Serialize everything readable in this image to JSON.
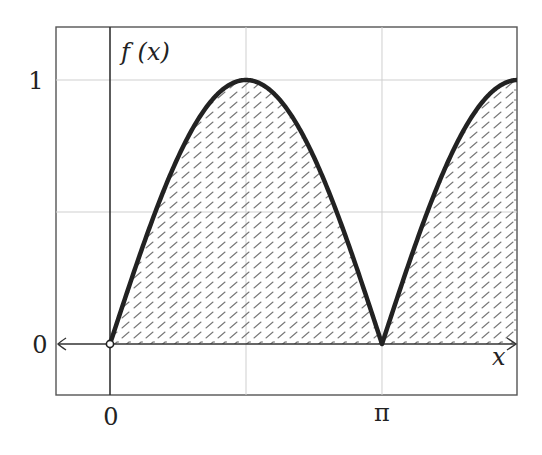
{
  "chart_data": {
    "type": "area",
    "title": "",
    "function": "f(x) = |sin x|",
    "xlabel": "x",
    "ylabel": "f (x)",
    "xlim": [
      -0.628,
      4.712
    ],
    "ylim": [
      -0.2,
      1.2
    ],
    "x_ticks": [
      {
        "value": 0,
        "label": "0"
      },
      {
        "value": 3.14159,
        "label": "π"
      }
    ],
    "y_ticks": [
      {
        "value": 0,
        "label": "0"
      },
      {
        "value": 1,
        "label": "1"
      }
    ],
    "grid": {
      "on": true,
      "x_lines": [
        0,
        1.5708,
        3.14159
      ],
      "y_lines": [
        0.5,
        1
      ]
    },
    "series": [
      {
        "name": "f(x)",
        "x": [
          0,
          0.3927,
          0.7854,
          1.1781,
          1.5708,
          1.9635,
          2.3562,
          2.7489,
          3.14159,
          3.5343,
          3.927,
          4.3197,
          4.7124
        ],
        "values": [
          0,
          0.383,
          0.707,
          0.924,
          1,
          0.924,
          0.707,
          0.383,
          0,
          0.383,
          0.707,
          0.924,
          1
        ],
        "fill": "hatched",
        "fill_range": [
          0,
          4.7124
        ]
      }
    ],
    "markers": [
      {
        "x": 0,
        "y": 0,
        "style": "open-circle"
      }
    ],
    "legend": null
  },
  "colors": {
    "curve": "#222222",
    "frame": "#555555",
    "grid": "#cfcfcf",
    "axis": "#333333",
    "hatch": "#777777"
  },
  "labels": {
    "y_axis": "f (x)",
    "x_axis": "x",
    "ytick_1": "1",
    "ytick_0": "0",
    "xtick_0": "0",
    "xtick_pi": "π"
  }
}
